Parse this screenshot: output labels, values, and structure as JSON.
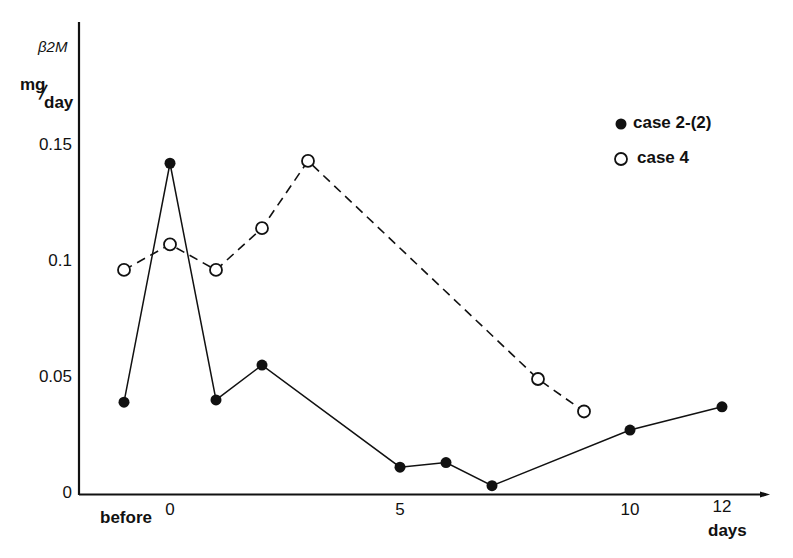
{
  "chart_data": {
    "type": "line",
    "title": "",
    "ylabel_line1": "β2M",
    "ylabel_unit_top": "mg",
    "ylabel_unit_bottom": "day",
    "xlabel": "days",
    "x_ticks": [
      {
        "label": "before",
        "x": -1
      },
      {
        "label": "0",
        "x": 0
      },
      {
        "label": "5",
        "x": 5
      },
      {
        "label": "10",
        "x": 10
      },
      {
        "label": "12",
        "x": 12
      }
    ],
    "y_ticks": [
      {
        "label": "0",
        "y": 0
      },
      {
        "label": "0.05",
        "y": 0.05
      },
      {
        "label": "0.1",
        "y": 0.1
      },
      {
        "label": "0.15",
        "y": 0.15
      }
    ],
    "ylim": [
      0,
      0.16
    ],
    "xlim": [
      -2,
      13
    ],
    "grid": false,
    "legend_position": "upper right",
    "series": [
      {
        "name": "case 2-(2)",
        "marker": "filled-circle",
        "line": "solid",
        "points": [
          {
            "x": -1,
            "y": 0.04
          },
          {
            "x": 0,
            "y": 0.143
          },
          {
            "x": 1,
            "y": 0.041
          },
          {
            "x": 2,
            "y": 0.056
          },
          {
            "x": 5,
            "y": 0.012
          },
          {
            "x": 6,
            "y": 0.014
          },
          {
            "x": 7,
            "y": 0.004
          },
          {
            "x": 10,
            "y": 0.028
          },
          {
            "x": 12,
            "y": 0.038
          }
        ]
      },
      {
        "name": "case 4",
        "marker": "open-circle",
        "line": "dashed",
        "points": [
          {
            "x": -1,
            "y": 0.097
          },
          {
            "x": 0,
            "y": 0.108
          },
          {
            "x": 1,
            "y": 0.097
          },
          {
            "x": 2,
            "y": 0.115
          },
          {
            "x": 3,
            "y": 0.144
          },
          {
            "x": 8,
            "y": 0.05
          },
          {
            "x": 9,
            "y": 0.036
          }
        ]
      }
    ]
  },
  "legend": {
    "items": [
      {
        "label": "case 2-(2)",
        "marker": "filled-circle"
      },
      {
        "label": "case 4",
        "marker": "open-circle"
      }
    ]
  },
  "colors": {
    "ink": "#111111",
    "background": "#ffffff"
  }
}
